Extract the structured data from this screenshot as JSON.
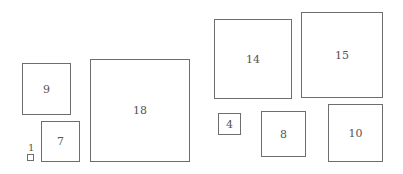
{
  "diagram": {
    "border_color": "#6e6e6e",
    "text_color": "#555555",
    "squares": [
      {
        "label": "9",
        "x": 22,
        "y": 63,
        "w": 49,
        "h": 52
      },
      {
        "label": "7",
        "x": 41,
        "y": 121,
        "w": 39,
        "h": 41
      },
      {
        "label": "1",
        "x": 27,
        "y": 154,
        "w": 7,
        "h": 7,
        "label_position": "above"
      },
      {
        "label": "18",
        "x": 90,
        "y": 59,
        "w": 100,
        "h": 103
      },
      {
        "label": "14",
        "x": 214,
        "y": 19,
        "w": 78,
        "h": 80
      },
      {
        "label": "15",
        "x": 301,
        "y": 12,
        "w": 82,
        "h": 86
      },
      {
        "label": "4",
        "x": 218,
        "y": 113,
        "w": 23,
        "h": 22
      },
      {
        "label": "8",
        "x": 261,
        "y": 111,
        "w": 45,
        "h": 46
      },
      {
        "label": "10",
        "x": 328,
        "y": 104,
        "w": 55,
        "h": 58
      }
    ]
  }
}
